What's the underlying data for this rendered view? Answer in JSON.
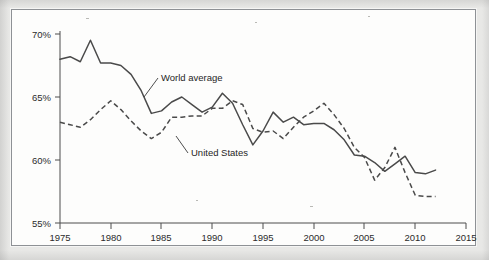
{
  "chart_data": {
    "type": "line",
    "title": "",
    "subtitle": "",
    "xlabel": "",
    "ylabel": "",
    "xlim": [
      1975,
      2015
    ],
    "ylim": [
      55,
      70
    ],
    "xticks": [
      1975,
      1980,
      1985,
      1990,
      1995,
      2000,
      2005,
      2010,
      2015
    ],
    "yticks": [
      55,
      60,
      65,
      70
    ],
    "xtick_labels": [
      "1975",
      "1980",
      "1985",
      "1990",
      "1995",
      "2000",
      "2005",
      "2010",
      "2015"
    ],
    "ytick_labels": [
      "55%",
      "60%",
      "65%",
      "70%"
    ],
    "grid": false,
    "legend": "inline-annotations",
    "annotations": [
      {
        "text": "World average",
        "series": "World average",
        "points_to_year": 1983
      },
      {
        "text": "United States",
        "series": "United States",
        "points_to_year": 1987
      }
    ],
    "x": [
      1975,
      1976,
      1977,
      1978,
      1979,
      1980,
      1981,
      1982,
      1983,
      1984,
      1985,
      1986,
      1987,
      1988,
      1989,
      1990,
      1991,
      1992,
      1993,
      1994,
      1995,
      1996,
      1997,
      1998,
      1999,
      2000,
      2001,
      2002,
      2003,
      2004,
      2005,
      2006,
      2007,
      2008,
      2009,
      2010,
      2011,
      2012
    ],
    "series": [
      {
        "name": "World average",
        "style": "solid",
        "values": [
          68.0,
          68.2,
          67.8,
          69.5,
          67.7,
          67.7,
          67.5,
          66.8,
          65.5,
          63.7,
          63.9,
          64.6,
          65.0,
          64.4,
          63.8,
          64.2,
          65.3,
          64.5,
          62.8,
          61.2,
          62.3,
          63.8,
          63.0,
          63.4,
          62.8,
          62.9,
          62.9,
          62.4,
          61.6,
          60.4,
          60.3,
          59.8,
          59.1,
          59.7,
          60.3,
          59.0,
          58.9,
          59.2
        ]
      },
      {
        "name": "United States",
        "style": "dashed",
        "values": [
          63.0,
          62.8,
          62.6,
          63.2,
          64.0,
          64.7,
          64.0,
          63.1,
          62.3,
          61.7,
          62.2,
          63.4,
          63.4,
          63.5,
          63.5,
          64.1,
          64.1,
          64.7,
          64.4,
          62.5,
          62.2,
          62.3,
          61.7,
          62.6,
          63.4,
          63.9,
          64.5,
          63.6,
          62.5,
          61.0,
          60.2,
          58.4,
          59.4,
          61.0,
          59.0,
          57.2,
          57.1,
          57.1
        ]
      }
    ]
  },
  "axis": {
    "y_labels": [
      "70%",
      "65%",
      "60%",
      "55%"
    ],
    "x_labels": [
      "1975",
      "1980",
      "1985",
      "1990",
      "1995",
      "2000",
      "2005",
      "2010",
      "2015"
    ]
  },
  "labels": {
    "world_average": "World average",
    "united_states": "United States"
  },
  "colors": {
    "line": "#4a4a4a",
    "axis": "#4d4d4d",
    "text": "#2b2b2b",
    "frame": "#8e9195",
    "page": "#e8e8e6",
    "plot_background": "#fdfdfc"
  }
}
